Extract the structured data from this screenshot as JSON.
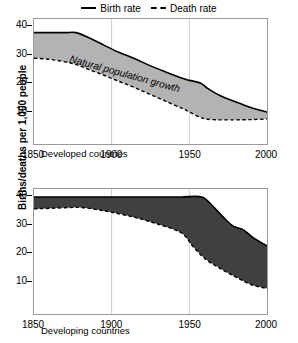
{
  "legend": {
    "entries": [
      {
        "label": "Birth rate",
        "style": "solid",
        "icon": "solid-line-icon"
      },
      {
        "label": "Death rate",
        "style": "dashed",
        "icon": "dashed-line-icon"
      }
    ]
  },
  "axis": {
    "y_title": "Births/deaths per 1,000 people",
    "y_ticks": [
      10,
      20,
      30,
      40
    ],
    "x_ticks": [
      1850,
      1900,
      1950,
      2000
    ]
  },
  "panels": [
    {
      "id": "top",
      "note": "Developed countries",
      "band_label": "Natural population growth"
    },
    {
      "id": "bottom",
      "note": "Developing countries",
      "band_label": ""
    }
  ],
  "colors": {
    "band_developed": "#b3b3b3",
    "band_developing": "#404040",
    "line": "#000000",
    "frame": "#9a9a9a",
    "gridline": "#cccccc"
  },
  "chart_data": {
    "type": "area",
    "title": "",
    "subtitle": "",
    "xlabel": "",
    "ylabel": "Births/deaths per 1,000 people",
    "xlim": [
      1850,
      2000
    ],
    "ylim": [
      0,
      44
    ],
    "grid": "vertical gridlines at 1900 and 1950",
    "legend_position": "top-center",
    "panels": [
      {
        "name": "Developed countries",
        "fill_color": "#b3b3b3",
        "band_label": "Natural population growth",
        "series": [
          {
            "name": "Birth rate",
            "style": "solid",
            "x": [
              1850,
              1860,
              1870,
              1877,
              1885,
              1895,
              1905,
              1915,
              1925,
              1935,
              1945,
              1950,
              1957,
              1962,
              1970,
              1980,
              1990,
              2000
            ],
            "values": [
              39.2,
              39.2,
              39.2,
              39.2,
              37.5,
              34.8,
              32.2,
              30.0,
              27.5,
              25.3,
              23.2,
              22.4,
              21.5,
              19.5,
              17.0,
              14.8,
              12.8,
              11.2
            ]
          },
          {
            "name": "Death rate",
            "style": "dashed",
            "x": [
              1850,
              1860,
              1870,
              1877,
              1885,
              1895,
              1905,
              1915,
              1925,
              1935,
              1945,
              1950,
              1957,
              1962,
              1970,
              1980,
              1990,
              2000
            ],
            "values": [
              30.2,
              29.8,
              28.9,
              28.0,
              26.3,
              24.2,
              22.0,
              19.8,
              17.4,
              15.0,
              12.6,
              11.3,
              9.4,
              8.7,
              8.5,
              8.5,
              8.6,
              8.8
            ]
          }
        ]
      },
      {
        "name": "Developing countries",
        "fill_color": "#404040",
        "band_label": "",
        "series": [
          {
            "name": "Birth rate",
            "style": "solid",
            "x": [
              1850,
              1870,
              1890,
              1910,
              1930,
              1945,
              1958,
              1965,
              1972,
              1978,
              1985,
              1992,
              2000
            ],
            "values": [
              41.2,
              41.2,
              41.2,
              41.2,
              41.2,
              41.2,
              41.2,
              38.0,
              34.0,
              31.0,
              29.5,
              26.5,
              24.0
            ]
          },
          {
            "name": "Death rate",
            "style": "dashed",
            "x": [
              1850,
              1870,
              1880,
              1890,
              1900,
              1915,
              1930,
              1945,
              1952,
              1960,
              1970,
              1980,
              1990,
              2000
            ],
            "values": [
              37.0,
              37.4,
              37.5,
              36.8,
              35.8,
              34.0,
              31.6,
              28.5,
              24.0,
              19.5,
              16.0,
              13.0,
              10.3,
              9.0
            ]
          }
        ]
      }
    ]
  }
}
